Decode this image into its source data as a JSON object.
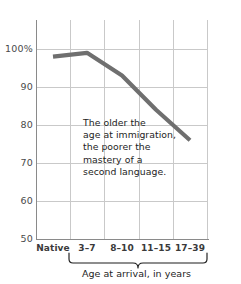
{
  "chart_data": {
    "type": "line",
    "title": "",
    "subtitle": "",
    "xlabel": "Age at arrival, in years",
    "ylabel": "",
    "categories": [
      "Native",
      "3–7",
      "8–10",
      "11–15",
      "17–39"
    ],
    "values": [
      98,
      99,
      93,
      84,
      76
    ],
    "series": [
      {
        "name": "Mastery of second language",
        "values": [
          98,
          99,
          93,
          84,
          76
        ]
      }
    ],
    "ylim": [
      50,
      100
    ],
    "yticks": [
      50,
      60,
      70,
      80,
      90,
      100
    ],
    "ytick_labels": [
      "50",
      "60",
      "70",
      "80",
      "90",
      "100%"
    ],
    "grid": true,
    "legend": false,
    "legend_position": "none",
    "line_color": "#6f6f6f",
    "grid_color": "#c9c9c9",
    "axis_color": "#8a8a8a",
    "annotations": [
      {
        "name": "insight-note",
        "lines": [
          "The older the",
          "age at immigration,",
          "the poorer the",
          "mastery of a",
          "second language."
        ]
      }
    ],
    "bracket": {
      "label": "Age at arrival, in years",
      "covers": [
        "3–7",
        "8–10",
        "11–15",
        "17–39"
      ]
    }
  },
  "axes": {
    "y_ticks": [
      {
        "label": "100%",
        "value": 100
      },
      {
        "label": "90",
        "value": 90
      },
      {
        "label": "80",
        "value": 80
      },
      {
        "label": "70",
        "value": 70
      },
      {
        "label": "60",
        "value": 60
      },
      {
        "label": "50",
        "value": 50
      }
    ],
    "x_ticks": [
      {
        "label": "Native"
      },
      {
        "label": "3–7"
      },
      {
        "label": "8–10"
      },
      {
        "label": "11–15"
      },
      {
        "label": "17–39"
      }
    ]
  },
  "annotation": {
    "line1": "The older the",
    "line2": "age at immigration,",
    "line3": "the poorer the",
    "line4": "mastery of a",
    "line5": "second language."
  },
  "footer": {
    "caption": "Age at arrival, in years"
  }
}
